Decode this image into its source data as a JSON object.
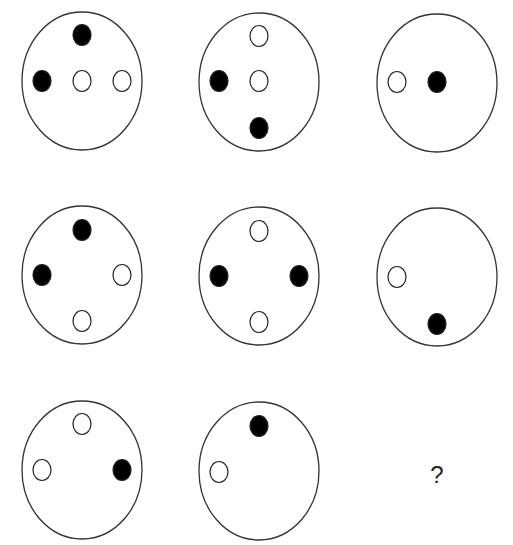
{
  "puzzle": {
    "question_mark": "?",
    "cells": [
      {
        "cx": 82,
        "cy": 81,
        "dots": [
          {
            "x": 82,
            "y": 35,
            "fill": "black"
          },
          {
            "x": 42,
            "y": 81,
            "fill": "black"
          },
          {
            "x": 82,
            "y": 81,
            "fill": "white"
          },
          {
            "x": 122,
            "y": 81,
            "fill": "white"
          }
        ]
      },
      {
        "cx": 259,
        "cy": 82,
        "dots": [
          {
            "x": 259,
            "y": 36,
            "fill": "white"
          },
          {
            "x": 219,
            "y": 81,
            "fill": "black"
          },
          {
            "x": 259,
            "y": 81,
            "fill": "white"
          },
          {
            "x": 259,
            "y": 128,
            "fill": "black"
          }
        ]
      },
      {
        "cx": 437,
        "cy": 83,
        "dots": [
          {
            "x": 397,
            "y": 82,
            "fill": "white"
          },
          {
            "x": 437,
            "y": 82,
            "fill": "black"
          }
        ]
      },
      {
        "cx": 82,
        "cy": 275,
        "dots": [
          {
            "x": 82,
            "y": 230,
            "fill": "black"
          },
          {
            "x": 42,
            "y": 275,
            "fill": "black"
          },
          {
            "x": 122,
            "y": 275,
            "fill": "white"
          },
          {
            "x": 82,
            "y": 321,
            "fill": "white"
          }
        ]
      },
      {
        "cx": 259,
        "cy": 276,
        "dots": [
          {
            "x": 259,
            "y": 231,
            "fill": "white"
          },
          {
            "x": 219,
            "y": 276,
            "fill": "black"
          },
          {
            "x": 299,
            "y": 276,
            "fill": "black"
          },
          {
            "x": 259,
            "y": 322,
            "fill": "white"
          }
        ]
      },
      {
        "cx": 437,
        "cy": 277,
        "dots": [
          {
            "x": 397,
            "y": 277,
            "fill": "white"
          },
          {
            "x": 437,
            "y": 324,
            "fill": "black"
          }
        ]
      },
      {
        "cx": 82,
        "cy": 470,
        "dots": [
          {
            "x": 82,
            "y": 424,
            "fill": "white"
          },
          {
            "x": 42,
            "y": 470,
            "fill": "white"
          },
          {
            "x": 122,
            "y": 470,
            "fill": "black"
          }
        ]
      },
      {
        "cx": 259,
        "cy": 471,
        "dots": [
          {
            "x": 259,
            "y": 426,
            "fill": "black"
          },
          {
            "x": 219,
            "y": 472,
            "fill": "white"
          }
        ]
      }
    ]
  }
}
